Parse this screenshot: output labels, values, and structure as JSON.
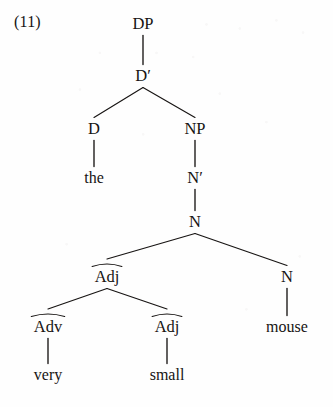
{
  "figure": {
    "example_number": "(11)",
    "phrase": "the very small mouse",
    "ink_color": "#171413",
    "background_color": "#fefefe"
  },
  "tree": {
    "nodes": [
      {
        "id": "dp",
        "label": "DP",
        "kind": "category",
        "x": 143,
        "y": 24,
        "arc": false
      },
      {
        "id": "dbar",
        "label": "D′",
        "kind": "category",
        "x": 143,
        "y": 76,
        "arc": false
      },
      {
        "id": "d",
        "label": "D",
        "kind": "category",
        "x": 94,
        "y": 129,
        "arc": false
      },
      {
        "id": "np",
        "label": "NP",
        "kind": "category",
        "x": 195,
        "y": 129,
        "arc": false
      },
      {
        "id": "the",
        "label": "the",
        "kind": "word",
        "x": 94,
        "y": 178,
        "arc": false
      },
      {
        "id": "nbar",
        "label": "N′",
        "kind": "category",
        "x": 195,
        "y": 178,
        "arc": false
      },
      {
        "id": "n-top",
        "label": "N",
        "kind": "category",
        "x": 195,
        "y": 222,
        "arc": false
      },
      {
        "id": "adj-upper",
        "label": "Adj",
        "kind": "category",
        "x": 107,
        "y": 277,
        "arc": true
      },
      {
        "id": "n-right",
        "label": "N",
        "kind": "category",
        "x": 287,
        "y": 277,
        "arc": false
      },
      {
        "id": "adv",
        "label": "Adv",
        "kind": "category",
        "x": 48,
        "y": 327,
        "arc": true
      },
      {
        "id": "adj-lower",
        "label": "Adj",
        "kind": "category",
        "x": 167,
        "y": 327,
        "arc": true
      },
      {
        "id": "mouse",
        "label": "mouse",
        "kind": "word",
        "x": 287,
        "y": 327,
        "arc": false
      },
      {
        "id": "very",
        "label": "very",
        "kind": "word",
        "x": 48,
        "y": 375,
        "arc": false
      },
      {
        "id": "small",
        "label": "small",
        "kind": "word",
        "x": 167,
        "y": 375,
        "arc": false
      }
    ],
    "edges": [
      {
        "from": "dp",
        "to": "dbar",
        "type": "stem"
      },
      {
        "from": "dbar",
        "to": "d",
        "type": "branch"
      },
      {
        "from": "dbar",
        "to": "np",
        "type": "branch"
      },
      {
        "from": "d",
        "to": "the",
        "type": "stem"
      },
      {
        "from": "np",
        "to": "nbar",
        "type": "stem"
      },
      {
        "from": "nbar",
        "to": "n-top",
        "type": "stem"
      },
      {
        "from": "n-top",
        "to": "adj-upper",
        "type": "branch"
      },
      {
        "from": "n-top",
        "to": "n-right",
        "type": "branch"
      },
      {
        "from": "adj-upper",
        "to": "adv",
        "type": "branch"
      },
      {
        "from": "adj-upper",
        "to": "adj-lower",
        "type": "branch"
      },
      {
        "from": "n-right",
        "to": "mouse",
        "type": "stem"
      },
      {
        "from": "adv",
        "to": "very",
        "type": "stem"
      },
      {
        "from": "adj-lower",
        "to": "small",
        "type": "stem"
      }
    ]
  }
}
